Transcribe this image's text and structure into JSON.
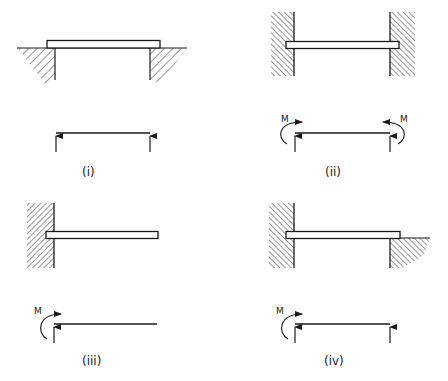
{
  "figure": {
    "ink_color": "#1a1a1a",
    "background": "#ffffff",
    "panels": [
      {
        "id": "i",
        "caption": "(i)",
        "description": "Simply supported beam resting on two supports",
        "support_left": "simple support (ground)",
        "support_right": "simple support (ground)",
        "fbd_reactions": [
          "vertical reaction left",
          "vertical reaction right"
        ],
        "moment_labels": []
      },
      {
        "id": "ii",
        "caption": "(ii)",
        "description": "Beam built into walls at both ends (fixed-fixed)",
        "support_left": "built-in wall",
        "support_right": "built-in wall",
        "fbd_reactions": [
          "vertical reaction left",
          "vertical reaction right"
        ],
        "moment_labels": [
          "M",
          "M"
        ]
      },
      {
        "id": "iii",
        "caption": "(iii)",
        "description": "Cantilever beam built into a wall at left end",
        "support_left": "built-in wall",
        "support_right": "free end",
        "fbd_reactions": [
          "vertical reaction left"
        ],
        "moment_labels": [
          "M"
        ]
      },
      {
        "id": "iv",
        "caption": "(iv)",
        "description": "Propped cantilever: built-in at left, simply supported at right",
        "support_left": "built-in wall",
        "support_right": "simple support (ground)",
        "fbd_reactions": [
          "vertical reaction left",
          "vertical reaction right"
        ],
        "moment_labels": [
          "M"
        ]
      }
    ]
  }
}
